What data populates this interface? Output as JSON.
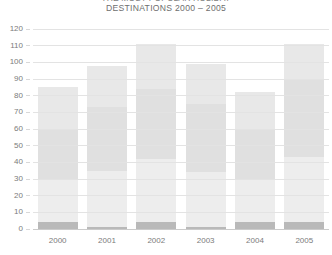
{
  "chart_data": {
    "type": "bar",
    "stacked": true,
    "title": "THE MOST POPULAR HOLIDAY",
    "subtitle": "DESTINATIONS 2000 – 2005",
    "xlabel": "",
    "ylabel": "",
    "ylim": [
      0,
      120
    ],
    "ytick_step": 10,
    "ytick_labels": [
      "0",
      "10",
      "20",
      "30",
      "40",
      "50",
      "60",
      "70",
      "80",
      "90",
      "100",
      "110",
      "120"
    ],
    "grid": true,
    "grid_axis": "y",
    "legend": false,
    "legend_position": "none",
    "categories": [
      "2000",
      "2001",
      "2002",
      "2003",
      "2004",
      "2005"
    ],
    "totals": [
      85,
      98,
      111,
      99,
      82,
      111
    ],
    "series": [
      {
        "name": "Series 1",
        "color": "#b9b9b9",
        "values": [
          4,
          1,
          4,
          1,
          4,
          4
        ]
      },
      {
        "name": "Series 2",
        "color": "#ededed",
        "values": [
          26,
          34,
          38,
          33,
          26,
          39
        ]
      },
      {
        "name": "Series 3",
        "color": "#e0e0e0",
        "values": [
          30,
          38,
          42,
          41,
          30,
          47
        ]
      },
      {
        "name": "Series 4",
        "color": "#e8e8e8",
        "values": [
          25,
          25,
          27,
          24,
          22,
          21
        ]
      }
    ],
    "colors": {
      "plot_background": "#ffffff",
      "gridline": "#e3e3e3",
      "axis": "#cbcbcb",
      "tick_label": "#7b7b7b",
      "title": "#6e6e6e"
    }
  }
}
